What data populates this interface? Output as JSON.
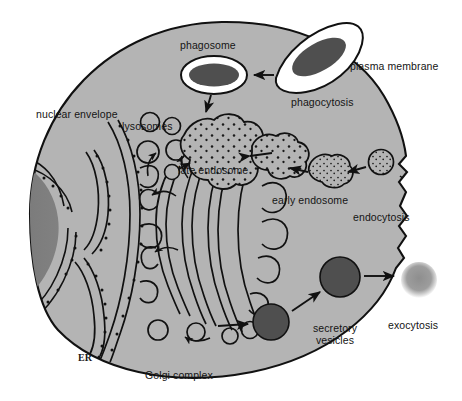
{
  "figure": {
    "type": "cell-biology-diagram",
    "background_color": "#ffffff",
    "cytoplasm_color": "#b4b4b4",
    "nucleus_color": "#7a7a7a",
    "vesicle_dark_color": "#4f4f4f",
    "exocytosed_vesicle_color": "#9a9a9a",
    "outline_color": "#111111",
    "membrane_white_color": "#ffffff"
  },
  "labels": {
    "phagosome": "phagosome",
    "plasma_membrane": "plasma membrane",
    "phagocytosis": "phagocytosis",
    "nuclear_envelope": "nuclear envelope",
    "lysosomes": "lysosomes",
    "late_endosome": "late endosome",
    "early_endosome": "early endosome",
    "endocytosis": "endocytosis",
    "exocytosis": "exocytosis",
    "secretory_vesicles_line1": "secretory",
    "secretory_vesicles_line2": "vesicles",
    "er": "ER",
    "golgi_complex": "Golgi complex"
  },
  "structures": [
    {
      "name": "cell-body",
      "description": "large rounded cell occupying most of frame"
    },
    {
      "name": "nucleus",
      "description": "dark gray nucleus at left edge, cropped by frame"
    },
    {
      "name": "nuclear-envelope",
      "description": "double membrane with ribosome dots surrounding nucleus"
    },
    {
      "name": "rough-er",
      "description": "ribosome-studded endoplasmic reticulum cisternae"
    },
    {
      "name": "golgi-complex",
      "description": "stacked curved cisternae with budding vesicles"
    },
    {
      "name": "phagosome",
      "description": "oval vacuole, dark core with white rim"
    },
    {
      "name": "engulfing-membrane",
      "description": "dark oval particle being engulfed at cell surface"
    },
    {
      "name": "lysosome",
      "description": "large irregular speckled organelle"
    },
    {
      "name": "late-endosome",
      "description": "irregular speckled vesicle"
    },
    {
      "name": "early-endosome",
      "description": "smaller irregular speckled vesicle"
    },
    {
      "name": "endocytic-vesicle",
      "description": "small round speckled vesicle near membrane invagination"
    },
    {
      "name": "secretory-vesicle-1",
      "description": "dark round vesicle near Golgi"
    },
    {
      "name": "secretory-vesicle-2",
      "description": "dark round vesicle approaching plasma membrane"
    },
    {
      "name": "released-vesicle",
      "description": "pale blurred vesicle released outside cell"
    }
  ],
  "arrows": [
    {
      "name": "arrow-engulf-to-phagosome",
      "from": "engulfing-membrane",
      "to": "phagosome"
    },
    {
      "name": "arrow-phagosome-to-lysosome",
      "from": "phagosome",
      "to": "lysosome"
    },
    {
      "name": "arrow-late-endosome-to-lysosome",
      "from": "late-endosome",
      "to": "lysosome"
    },
    {
      "name": "arrow-early-to-late-endosome",
      "from": "early-endosome",
      "to": "late-endosome"
    },
    {
      "name": "arrow-endocytic-to-early-endosome",
      "from": "endocytic-vesicle",
      "to": "early-endosome"
    },
    {
      "name": "arrow-golgi-vesicle-to-lysosome",
      "from": "golgi-vesicle",
      "to": "lysosome"
    },
    {
      "name": "arrow-er-to-golgi",
      "from": "rough-er",
      "to": "golgi-complex"
    },
    {
      "name": "arrow-golgi-to-secretory-vesicle",
      "from": "golgi-complex",
      "to": "secretory-vesicle-1"
    },
    {
      "name": "arrow-secretory-1-to-2",
      "from": "secretory-vesicle-1",
      "to": "secretory-vesicle-2"
    },
    {
      "name": "arrow-secretory-2-to-exterior",
      "from": "secretory-vesicle-2",
      "to": "released-vesicle"
    }
  ]
}
